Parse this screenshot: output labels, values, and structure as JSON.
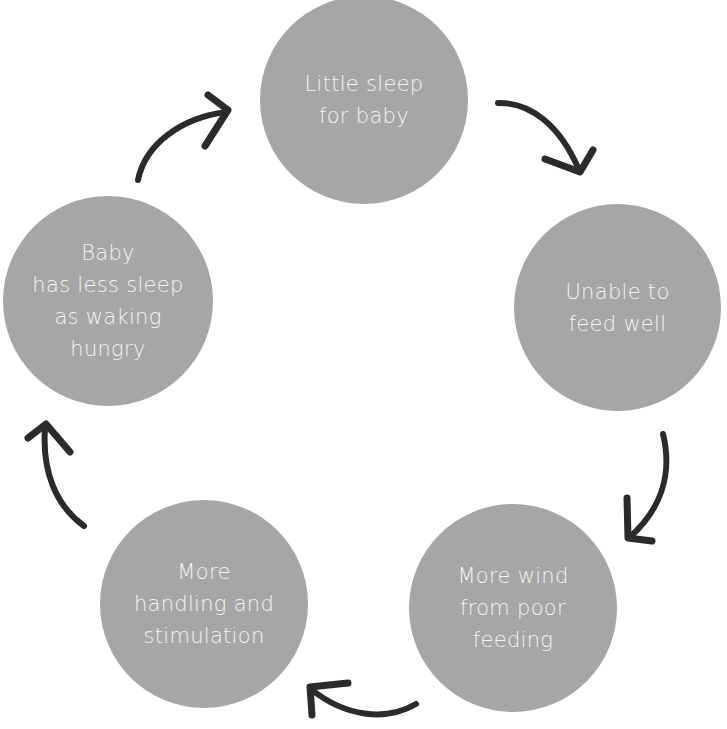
{
  "diagram": {
    "type": "cycle",
    "colors": {
      "node_fill": "#a6a6a6",
      "node_text": "#f4f4f4",
      "arrow": "#2b2b2b",
      "background": "#ffffff"
    },
    "nodes": [
      {
        "id": "n1",
        "label": "Little sleep\nfor baby"
      },
      {
        "id": "n2",
        "label": "Unable to\nfeed well"
      },
      {
        "id": "n3",
        "label": "More wind\nfrom poor\nfeeding"
      },
      {
        "id": "n4",
        "label": "More\nhandling and\nstimulation"
      },
      {
        "id": "n5",
        "label": "Baby\nhas less sleep\nas waking\nhungry"
      }
    ],
    "edges": [
      {
        "from": "n1",
        "to": "n2"
      },
      {
        "from": "n2",
        "to": "n3"
      },
      {
        "from": "n3",
        "to": "n4"
      },
      {
        "from": "n4",
        "to": "n5"
      },
      {
        "from": "n5",
        "to": "n1"
      }
    ]
  }
}
